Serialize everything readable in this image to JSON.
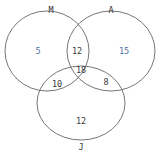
{
  "diagram": {
    "type": "venn",
    "sets": [
      {
        "id": "M",
        "label": "M"
      },
      {
        "id": "A",
        "label": "A"
      },
      {
        "id": "J",
        "label": "J"
      }
    ],
    "regions": {
      "M_only": "5",
      "A_only": "15",
      "J_only": "12",
      "M_A_only": "12",
      "M_J_only": "10",
      "A_J_only": "8",
      "M_A_J": "18"
    },
    "colors": {
      "outline": "#555555",
      "text": "#3a3a3a",
      "accent": "#4a6fa5"
    }
  }
}
